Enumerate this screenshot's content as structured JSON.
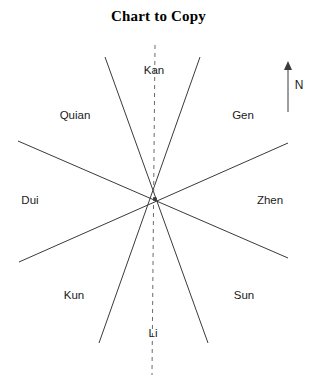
{
  "title": "Chart to Copy",
  "canvas": {
    "width": 317,
    "height": 385,
    "background": "#ffffff"
  },
  "colors": {
    "line": "#3a3a3a",
    "dashed_line": "#6b6b6b",
    "text": "#1a1a1a",
    "title": "#000000"
  },
  "diagram": {
    "type": "radial-compass",
    "center": {
      "x": 155,
      "y": 199
    },
    "center_dot_radius": 2,
    "solid_lines": [
      {
        "name": "kan-kun-axis",
        "x1": 105,
        "y1": 57,
        "x2": 208,
        "y2": 343
      },
      {
        "name": "gen-kun-axis",
        "x1": 200,
        "y1": 57,
        "x2": 99,
        "y2": 343
      },
      {
        "name": "quian-zhen-axis",
        "x1": 18,
        "y1": 141,
        "x2": 288,
        "y2": 258
      },
      {
        "name": "dui-gen-axis",
        "x1": 19,
        "y1": 262,
        "x2": 288,
        "y2": 143
      }
    ],
    "dashed_line": {
      "name": "meridian",
      "x1": 155,
      "y1": 45,
      "x2": 152,
      "y2": 375
    },
    "labels": [
      {
        "name": "kan",
        "text": "Kan",
        "x": 154,
        "y": 70
      },
      {
        "name": "quian",
        "text": "Quian",
        "x": 75,
        "y": 115
      },
      {
        "name": "gen",
        "text": "Gen",
        "x": 243,
        "y": 115
      },
      {
        "name": "dui",
        "text": "Dui",
        "x": 30,
        "y": 200
      },
      {
        "name": "zhen",
        "text": "Zhen",
        "x": 270,
        "y": 200
      },
      {
        "name": "kun",
        "text": "Kun",
        "x": 74,
        "y": 295
      },
      {
        "name": "sun",
        "text": "Sun",
        "x": 244,
        "y": 295
      },
      {
        "name": "li",
        "text": "Li",
        "x": 153,
        "y": 333
      }
    ]
  },
  "north_arrow": {
    "label": "N",
    "label_x": 299,
    "label_y": 85,
    "shaft_x": 288,
    "shaft_top_y": 66,
    "shaft_bottom_y": 112
  }
}
